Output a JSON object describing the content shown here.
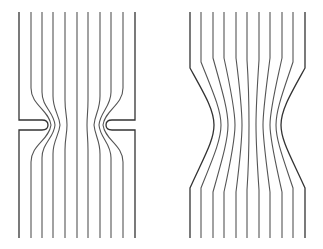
{
  "diagram": {
    "panels": [
      {
        "id": "orifice",
        "description": "Flow through a sharp-edged orifice plate",
        "streamline_count": 11,
        "stroke": "#555555"
      },
      {
        "id": "nozzle",
        "description": "Flow through a smooth converging-diverging contraction",
        "streamline_count": 11,
        "stroke": "#555555"
      }
    ]
  }
}
